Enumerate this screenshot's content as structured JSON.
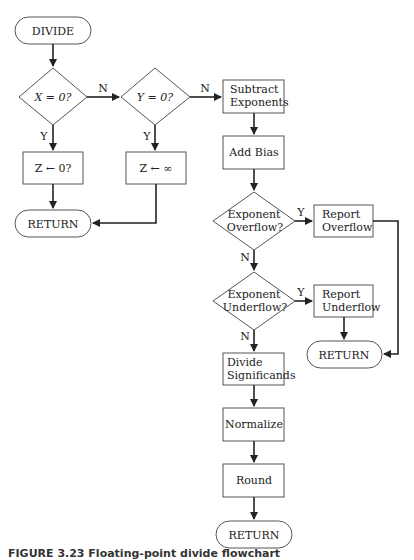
{
  "nodes": {
    "divide": "DIVIDE",
    "x_zero": "X = 0?",
    "y_zero": "Y = 0?",
    "z_zero": "Z ← 0?",
    "z_inf": "Z ← ∞",
    "return1": "RETURN",
    "subtract_1": "Subtract",
    "subtract_2": "Exponents",
    "add_bias": "Add Bias",
    "ovf_1": "Exponent",
    "ovf_2": "Overflow?",
    "rep_ovf_1": "Report",
    "rep_ovf_2": "Overflow",
    "unf_1": "Exponent",
    "unf_2": "Underflow?",
    "rep_unf_1": "Report",
    "rep_unf_2": "Underflow",
    "return2": "RETURN",
    "div_sig_1": "Divide",
    "div_sig_2": "Significands",
    "normalize": "Normalize",
    "round": "Round",
    "return3": "RETURN"
  },
  "edges": {
    "x_n": "N",
    "x_y": "Y",
    "y_n": "N",
    "y_y": "Y",
    "ovf_y": "Y",
    "ovf_n": "N",
    "unf_y": "Y",
    "unf_n": "N"
  },
  "caption": "FIGURE 3.23   Floating-point divide flowchart"
}
